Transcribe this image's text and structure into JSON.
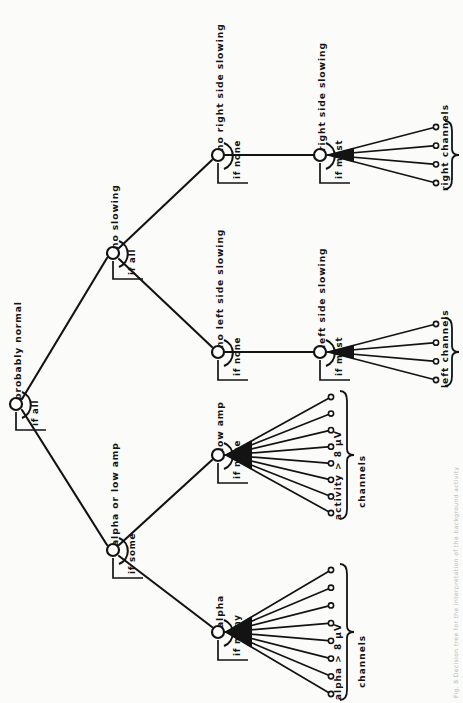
{
  "figure": {
    "orientation": "rotated-90-ccw",
    "type": "decision-tree",
    "caption": "Fig. 8  Decision tree for the interpretation of the background activity",
    "ink_color": "#131313",
    "page_color": "#fbfbfa"
  },
  "nodes": [
    {
      "id": "root",
      "label": "probably normal",
      "condition": "if all",
      "x": 16,
      "y": 404,
      "kind": "branch"
    },
    {
      "id": "no-slowing",
      "label": "no slowing",
      "condition": "if all",
      "x": 113,
      "y": 253,
      "kind": "branch"
    },
    {
      "id": "alpha-low",
      "label": "alpha or low amp",
      "condition": "if some",
      "x": 113,
      "y": 550,
      "kind": "branch"
    },
    {
      "id": "no-right",
      "label": "no right side slowing",
      "condition": "if none",
      "x": 218,
      "y": 155,
      "kind": "branch"
    },
    {
      "id": "no-left",
      "label": "no left side slowing",
      "condition": "if none",
      "x": 218,
      "y": 352,
      "kind": "branch"
    },
    {
      "id": "low-amp",
      "label": "low amp",
      "condition": "if none",
      "x": 218,
      "y": 455,
      "kind": "leaf-fan"
    },
    {
      "id": "alpha",
      "label": "alpha",
      "condition": "if many",
      "x": 218,
      "y": 632,
      "kind": "leaf-fan"
    },
    {
      "id": "right-slow",
      "label": "right side slowing",
      "condition": "if most",
      "x": 320,
      "y": 155,
      "kind": "leaf-fan"
    },
    {
      "id": "left-slow",
      "label": "left side slowing",
      "condition": "if most",
      "x": 320,
      "y": 352,
      "kind": "leaf-fan"
    }
  ],
  "edges": [
    {
      "from": "root",
      "to": "no-slowing"
    },
    {
      "from": "root",
      "to": "alpha-low"
    },
    {
      "from": "no-slowing",
      "to": "no-right"
    },
    {
      "from": "no-slowing",
      "to": "no-left"
    },
    {
      "from": "alpha-low",
      "to": "low-amp"
    },
    {
      "from": "alpha-low",
      "to": "alpha"
    },
    {
      "from": "no-right",
      "to": "right-slow"
    },
    {
      "from": "no-left",
      "to": "left-slow"
    }
  ],
  "fans": [
    {
      "node": "alpha",
      "count": 8,
      "brace_label": "alpha > 8 µV",
      "brace_sub": "channels"
    },
    {
      "node": "low-amp",
      "count": 8,
      "brace_label": "activity > 8 µV",
      "brace_sub": "channels"
    },
    {
      "node": "left-slow",
      "count": 4,
      "brace_label": "left channels",
      "brace_sub": ""
    },
    {
      "node": "right-slow",
      "count": 4,
      "brace_label": "right channels",
      "brace_sub": ""
    }
  ]
}
